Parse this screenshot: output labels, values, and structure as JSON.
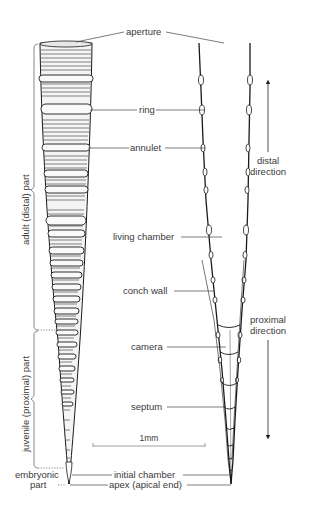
{
  "figure": {
    "labels": {
      "aperture": "aperture",
      "ring": "ring",
      "annulet": "annulet",
      "living_chamber": "living chamber",
      "conch_wall": "conch wall",
      "camera": "camera",
      "septum": "septum",
      "initial_chamber": "initial chamber",
      "apex": "apex (apical end)"
    },
    "regions": {
      "adult": "adult (distal) part",
      "juvenile": "juvenile (proximal) part",
      "embryonic_line1": "embryonic",
      "embryonic_line2": "part"
    },
    "directions": {
      "distal_line1": "distal",
      "distal_line2": "direction",
      "proximal_line1": "proximal",
      "proximal_line2": "direction"
    },
    "scale_bar": {
      "label": "1mm"
    },
    "colors": {
      "ink": "#1a1a1a",
      "leader": "#555555",
      "text": "#3a3a3a",
      "background": "#ffffff"
    }
  }
}
